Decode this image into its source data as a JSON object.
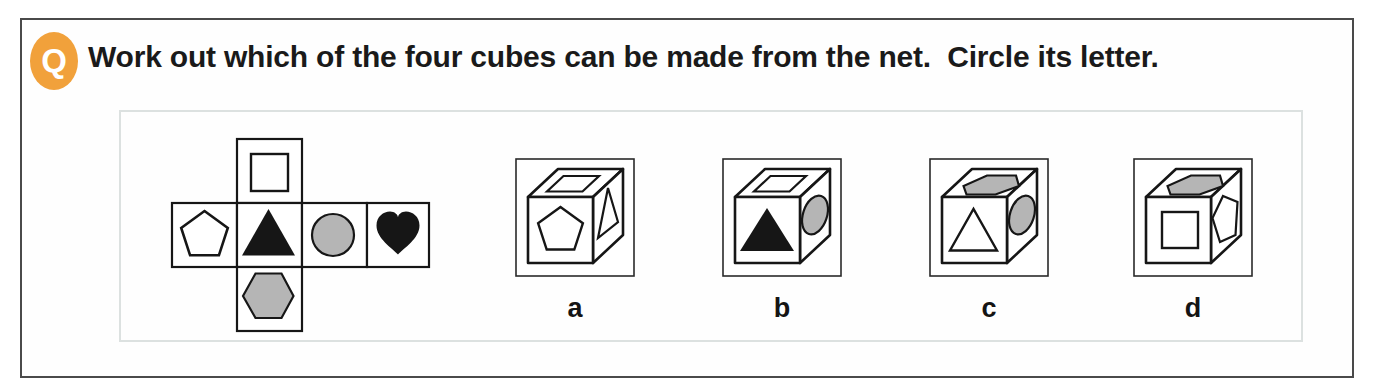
{
  "question": {
    "badge": "Q",
    "text": "Work out which of the four cubes can be made from the net.  Circle its letter."
  },
  "net": {
    "description": "cross-shaped net of six square faces",
    "faces": [
      {
        "position": "top",
        "shape": "white-square-outline"
      },
      {
        "position": "middle-1",
        "shape": "white-pentagon-outline"
      },
      {
        "position": "middle-2",
        "shape": "black-triangle"
      },
      {
        "position": "middle-3",
        "shape": "gray-circle"
      },
      {
        "position": "middle-4",
        "shape": "black-heart"
      },
      {
        "position": "bottom",
        "shape": "gray-hexagon"
      }
    ]
  },
  "options": [
    {
      "letter": "a",
      "front_face": "white-pentagon-outline",
      "top_face": "white-square-outline",
      "right_face": "white-triangle-outline"
    },
    {
      "letter": "b",
      "front_face": "black-triangle",
      "top_face": "white-square-outline",
      "right_face": "gray-circle"
    },
    {
      "letter": "c",
      "front_face": "white-triangle-outline",
      "top_face": "gray-hexagon",
      "right_face": "gray-circle"
    },
    {
      "letter": "d",
      "front_face": "white-square-outline",
      "top_face": "gray-hexagon",
      "right_face": "white-pentagon-outline"
    }
  ],
  "colors": {
    "badge_orange": "#f1a13b",
    "ink_black": "#161616",
    "shape_gray": "#b5b5b5",
    "outer_border": "#4a4a4a",
    "inner_border": "#dce1e0"
  }
}
